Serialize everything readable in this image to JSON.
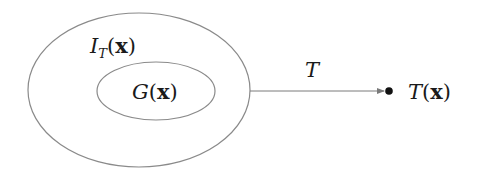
{
  "diagram": {
    "outer_set": {
      "label_main": "I",
      "label_sub": "T",
      "label_arg_open": "(",
      "label_arg": "x",
      "label_arg_close": ")",
      "stroke_color": "#8a8a8a"
    },
    "inner_set": {
      "label_main": "G",
      "label_arg_open": "(",
      "label_arg": "x",
      "label_arg_close": ")",
      "stroke_color": "#8a8a8a"
    },
    "map_arrow": {
      "label": "T",
      "color": "#7a7a7a"
    },
    "image_point": {
      "label_main": "T",
      "label_arg_open": "(",
      "label_arg": "x",
      "label_arg_close": ")",
      "color": "#111111"
    }
  }
}
